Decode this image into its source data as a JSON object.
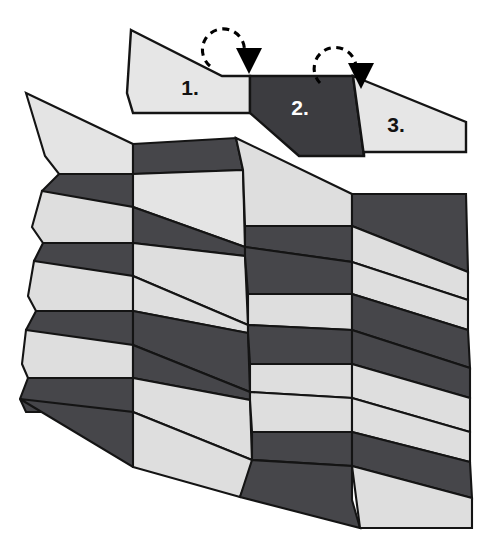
{
  "figure": {
    "background_color": "#ffffff",
    "outline_color": "#141414",
    "canvas": {
      "width": 499,
      "height": 549
    }
  },
  "palette": {
    "light": "#DCDCDC",
    "light_alt": "#E2E2E2",
    "dark": "#3C3C40",
    "dark_alt": "#4A4A4E",
    "stroke": "#141414",
    "white": "#FFFFFF",
    "black": "#000000"
  },
  "strip": {
    "caption": "Folding sequence strip",
    "segments": [
      {
        "id": "segment-1",
        "label": "1.",
        "tone": "light",
        "fill": "#E6E6E6",
        "label_color": "#121212",
        "label_x": 190,
        "label_y": 95,
        "points": "131,30 222,76 250,76 250,113 133,113 127,93"
      },
      {
        "id": "segment-2",
        "label": "2.",
        "tone": "dark",
        "fill": "#3C3C40",
        "label_color": "#FFFFFF",
        "label_x": 300,
        "label_y": 115,
        "points": "250,76 353,76 364,156 299,156 250,113"
      },
      {
        "id": "segment-3",
        "label": "3.",
        "tone": "light",
        "fill": "#E6E6E6",
        "label_color": "#121212",
        "label_x": 396,
        "label_y": 132,
        "points": "353,76 466,122 466,152 364,152 364,156"
      }
    ]
  },
  "arrows": [
    {
      "id": "fold-arrow-1",
      "kind": "rotation-arrow",
      "direction": "clockwise-down",
      "arc": "M 210,66 A 21 21 0 1 1 244,54",
      "arrowhead": "236,48 262,48 249,74"
    },
    {
      "id": "fold-arrow-2",
      "kind": "rotation-arrow",
      "direction": "clockwise-down",
      "arc": "M 320,83 A 21 21 0 1 1 356,71",
      "arrowhead": "348,63 374,63 361,89"
    }
  ],
  "tessellation": {
    "caption": "Pleated tessellation field",
    "rows": 5,
    "columns": 4,
    "cell_pattern": "each cell split by a diagonal into an upper and a lower trapezoid with alternating light/dark tones",
    "facets": [
      {
        "id": "r1c1-a",
        "tone": "light",
        "fill": "#E4E4E4",
        "points": "26,93 133,144 133,174 59,174 45,156"
      },
      {
        "id": "r1c1-b",
        "tone": "dark",
        "fill": "#46464A",
        "points": "59,174 133,174 133,207 47,207 42,191"
      },
      {
        "id": "r1c2-a",
        "tone": "dark",
        "fill": "#46464A",
        "points": "133,144 236,138 243,170 133,174"
      },
      {
        "id": "r1c2-b",
        "tone": "light",
        "fill": "#E4E4E4",
        "points": "133,174 243,170 245,247 133,207"
      },
      {
        "id": "r1c3-a",
        "tone": "light",
        "fill": "#DEDEDE",
        "points": "236,138 352,194 352,226 245,226 243,170"
      },
      {
        "id": "r1c3-b",
        "tone": "dark",
        "fill": "#46464A",
        "points": "245,226 352,226 352,262 245,247"
      },
      {
        "id": "r1c4-a",
        "tone": "dark",
        "fill": "#46464A",
        "points": "352,194 466,194 468,272 352,226"
      },
      {
        "id": "r1c4-b",
        "tone": "light",
        "fill": "#DEDEDE",
        "points": "352,226 468,272 468,300 352,262"
      },
      {
        "id": "r2c1-a",
        "tone": "light",
        "fill": "#DEDEDE",
        "points": "42,191 133,207 133,243 43,243 32,227"
      },
      {
        "id": "r2c1-b",
        "tone": "dark",
        "fill": "#46464A",
        "points": "43,243 133,243 133,276 41,276 34,261"
      },
      {
        "id": "r2c2-a",
        "tone": "dark",
        "fill": "#46464A",
        "points": "133,207 245,247 245,256 133,243"
      },
      {
        "id": "r2c2-b",
        "tone": "light",
        "fill": "#DEDEDE",
        "points": "133,243 245,256 248,325 133,276"
      },
      {
        "id": "r2c3-a",
        "tone": "dark",
        "fill": "#46464A",
        "points": "245,247 352,262 352,294 248,294 245,256"
      },
      {
        "id": "r2c3-b",
        "tone": "light",
        "fill": "#DEDEDE",
        "points": "248,294 352,294 352,330 248,325"
      },
      {
        "id": "r2c4-a",
        "tone": "light",
        "fill": "#DEDEDE",
        "points": "352,262 468,300 468,330 352,294"
      },
      {
        "id": "r2c4-b",
        "tone": "dark",
        "fill": "#46464A",
        "points": "352,294 468,330 470,368 352,330"
      },
      {
        "id": "r3c1-a",
        "tone": "light",
        "fill": "#DEDEDE",
        "points": "34,261 133,276 133,311 36,311 28,296"
      },
      {
        "id": "r3c1-b",
        "tone": "dark",
        "fill": "#46464A",
        "points": "36,311 133,311 133,345 33,345 26,330"
      },
      {
        "id": "r3c2-a",
        "tone": "light",
        "fill": "#DEDEDE",
        "points": "133,276 248,325 248,333 133,311"
      },
      {
        "id": "r3c2-b",
        "tone": "dark",
        "fill": "#46464A",
        "points": "133,311 248,333 250,392 133,345"
      },
      {
        "id": "r3c3-a",
        "tone": "dark",
        "fill": "#46464A",
        "points": "248,325 352,330 352,364 250,364 248,333"
      },
      {
        "id": "r3c3-b",
        "tone": "light",
        "fill": "#DEDEDE",
        "points": "250,364 352,364 352,398 250,392"
      },
      {
        "id": "r3c4-a",
        "tone": "dark",
        "fill": "#46464A",
        "points": "352,330 470,368 470,398 352,364"
      },
      {
        "id": "r3c4-b",
        "tone": "light",
        "fill": "#DEDEDE",
        "points": "352,364 470,398 470,432 352,398"
      },
      {
        "id": "r4c1-a",
        "tone": "light",
        "fill": "#DEDEDE",
        "points": "26,330 133,345 133,378 28,378 22,364"
      },
      {
        "id": "r4c1-b",
        "tone": "dark",
        "fill": "#46464A",
        "points": "28,378 133,378 133,412 26,412 20,399"
      },
      {
        "id": "r4c2-a",
        "tone": "dark",
        "fill": "#46464A",
        "points": "133,345 250,392 250,400 133,378"
      },
      {
        "id": "r4c2-b",
        "tone": "light",
        "fill": "#DEDEDE",
        "points": "133,378 250,400 252,460 133,412"
      },
      {
        "id": "r4c3-a",
        "tone": "light",
        "fill": "#DEDEDE",
        "points": "250,392 352,398 352,432 252,432 250,400"
      },
      {
        "id": "r4c3-b",
        "tone": "dark",
        "fill": "#46464A",
        "points": "252,432 352,432 352,466 252,460"
      },
      {
        "id": "r4c4-a",
        "tone": "light",
        "fill": "#DEDEDE",
        "points": "352,398 470,432 470,462 352,432"
      },
      {
        "id": "r4c4-b",
        "tone": "dark",
        "fill": "#46464A",
        "points": "352,432 470,462 472,498 352,466"
      },
      {
        "id": "r5c1-b",
        "tone": "dark",
        "fill": "#46464A",
        "points": "20,399 133,412 133,444 152,467 133,467"
      },
      {
        "id": "r5c2-b",
        "tone": "light",
        "fill": "#DEDEDE",
        "points": "133,412 252,460 252,468 240,497 133,467"
      },
      {
        "id": "r5c3-b",
        "tone": "dark",
        "fill": "#46464A",
        "points": "252,460 352,466 352,500 360,528 240,497"
      },
      {
        "id": "r5c4-b",
        "tone": "light",
        "fill": "#DEDEDE",
        "points": "352,466 472,498 472,528 360,528"
      }
    ]
  }
}
